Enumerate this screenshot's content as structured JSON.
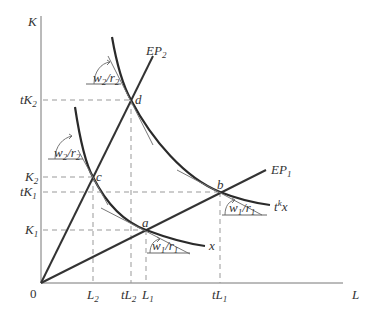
{
  "diagram": {
    "type": "isoquant-expansion-path",
    "axes": {
      "y_label": "K",
      "x_label": "L",
      "origin_label": "0"
    },
    "y_ticks": [
      {
        "main": "tK",
        "sub": "2",
        "key": "tK2"
      },
      {
        "main": "K",
        "sub": "2",
        "key": "K2"
      },
      {
        "main": "tK",
        "sub": "1",
        "key": "tK1"
      },
      {
        "main": "K",
        "sub": "1",
        "key": "K1"
      }
    ],
    "x_ticks": [
      {
        "main": "L",
        "sub": "2",
        "key": "L2"
      },
      {
        "main": "tL",
        "sub": "2",
        "key": "tL2"
      },
      {
        "main": "L",
        "sub": "1",
        "key": "L1"
      },
      {
        "main": "tL",
        "sub": "1",
        "key": "tL1"
      }
    ],
    "expansion_paths": [
      {
        "main": "EP",
        "sub": "2",
        "through": [
          "c",
          "d"
        ]
      },
      {
        "main": "EP",
        "sub": "1",
        "through": [
          "a",
          "b"
        ]
      }
    ],
    "isoquants": [
      {
        "label": "x",
        "points": [
          "c",
          "a"
        ]
      },
      {
        "label_main": "t",
        "label_sup": "k",
        "label_tail": "x",
        "points": [
          "d",
          "b"
        ]
      }
    ],
    "points": {
      "a": "a",
      "b": "b",
      "c": "c",
      "d": "d"
    },
    "price_ratios": [
      {
        "w": "w",
        "w_sub": "2",
        "r": "r",
        "r_sub": "2",
        "at": "d"
      },
      {
        "w": "w",
        "w_sub": "2",
        "r": "r",
        "r_sub": "2",
        "at": "c"
      },
      {
        "w": "w",
        "w_sub": "1",
        "r": "r",
        "r_sub": "1",
        "at": "a"
      },
      {
        "w": "w",
        "w_sub": "1",
        "r": "r",
        "r_sub": "1",
        "at": "b"
      }
    ],
    "colors": {
      "curve": "#2a2a2a",
      "dashed_guides": "#999999",
      "axis": "#777777"
    }
  }
}
